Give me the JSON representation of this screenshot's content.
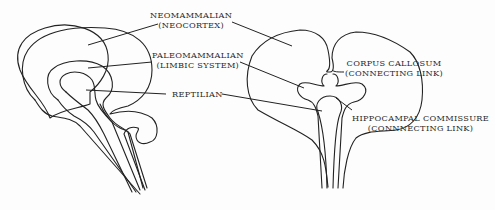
{
  "diagram": {
    "type": "triune-brain",
    "views": [
      "sagittal-section",
      "coronal-section"
    ],
    "labels": {
      "neomammalian": {
        "line1": "NEOMAMMALIAN",
        "line2": "(NEOCORTEX)"
      },
      "paleomammalian": {
        "line1": "PALEOMAMMALIAN",
        "line2": "(LIMBIC SYSTEM)"
      },
      "reptilian": {
        "line1": "REPTILIAN"
      },
      "corpus_callosum": {
        "line1": "CORPUS CALLOSUM",
        "line2": "(CONNECTING LINK)"
      },
      "hippocampal_commissure": {
        "line1": "HIPPOCAMPAL COMMISSURE",
        "line2": "(CONNNECTING LINK)"
      }
    },
    "colors": {
      "ink": "#222222",
      "background": "#fdfdfd"
    }
  }
}
